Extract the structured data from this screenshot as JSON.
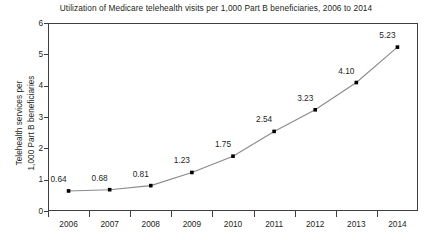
{
  "chart_data": {
    "type": "line",
    "title": "Utilization of Medicare telehealth visits per 1,000 Part B beneficiaries, 2006 to 2014",
    "xlabel": "",
    "ylabel_lines": [
      "Telehealth services per",
      "1,000 Part B beneficiaries"
    ],
    "categories": [
      "2006",
      "2007",
      "2008",
      "2009",
      "2010",
      "2011",
      "2012",
      "2013",
      "2014"
    ],
    "values": [
      0.64,
      0.68,
      0.81,
      1.23,
      1.75,
      2.54,
      3.23,
      4.1,
      5.23
    ],
    "point_labels": [
      "0.64",
      "0.68",
      "0.81",
      "1.23",
      "1.75",
      "2.54",
      "3.23",
      "4.10",
      "5.23"
    ],
    "ylim": [
      0,
      6
    ],
    "yticks": [
      0,
      1,
      2,
      3,
      4,
      5,
      6
    ],
    "ytick_labels": [
      "0",
      "1",
      "2",
      "3",
      "4",
      "5",
      "6"
    ],
    "grid": false,
    "legend": "none",
    "marker": "square",
    "marker_color": "#000000",
    "line_color": "#8a8a8a",
    "axis_color": "#3f3f3f",
    "text_color": "#231f20",
    "background": "#ffffff"
  }
}
